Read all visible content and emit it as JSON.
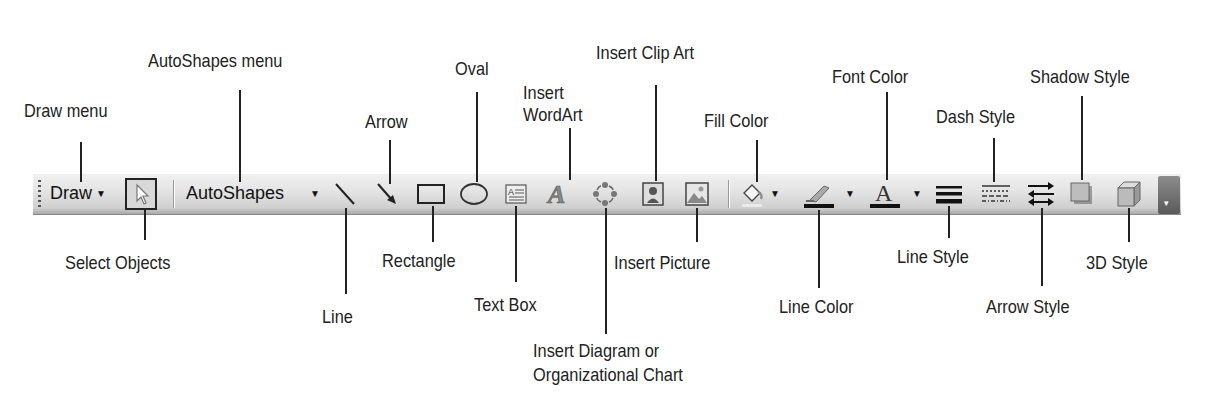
{
  "toolbar": {
    "draw_label": "Draw",
    "autoshapes_label": "AutoShapes",
    "dropdown_glyph": "▼",
    "overflow_glyph": "▾"
  },
  "icons": [
    "select-objects-arrow",
    "line",
    "arrow",
    "rectangle",
    "oval",
    "text-box",
    "wordart",
    "diagram",
    "clip-art",
    "picture",
    "fill-color-bucket",
    "line-color-brush",
    "font-color-a",
    "line-style",
    "dash-style",
    "arrow-style",
    "shadow-style",
    "3d-style"
  ],
  "labels_top": {
    "draw_menu": "Draw menu",
    "autoshapes_menu": "AutoShapes menu",
    "arrow": "Arrow",
    "oval": "Oval",
    "wordart_l1": "Insert",
    "wordart_l2": "WordArt",
    "clip_art": "Insert Clip Art",
    "fill_color": "Fill Color",
    "font_color": "Font Color",
    "dash_style": "Dash Style",
    "shadow_style": "Shadow Style"
  },
  "labels_bottom": {
    "select_objects": "Select Objects",
    "line": "Line",
    "rectangle": "Rectangle",
    "text_box": "Text Box",
    "diagram_l1": "Insert Diagram or",
    "diagram_l2": "Organizational Chart",
    "picture": "Insert Picture",
    "line_color": "Line Color",
    "line_style": "Line Style",
    "arrow_style": "Arrow Style",
    "style_3d": "3D Style"
  }
}
